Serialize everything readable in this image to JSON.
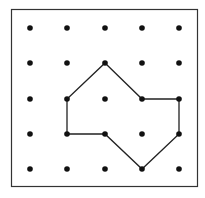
{
  "diagram": {
    "type": "geoboard",
    "grid": {
      "columns": 5,
      "rows": 5
    },
    "polygon": {
      "description": "octagon-like shape on dot grid",
      "vertices": [
        [
          2,
          1
        ],
        [
          3,
          2
        ],
        [
          4,
          2
        ],
        [
          4,
          3
        ],
        [
          3,
          4
        ],
        [
          2,
          3
        ],
        [
          1,
          3
        ],
        [
          1,
          2
        ]
      ]
    },
    "colors": {
      "dot": "#111111",
      "line": "#222222",
      "border": "#333333",
      "background": "#ffffff"
    }
  }
}
